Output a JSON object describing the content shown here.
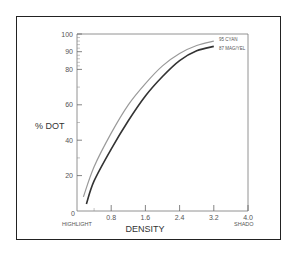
{
  "chart_data": {
    "type": "line",
    "title": "",
    "xlabel": "DENSITY",
    "ylabel": "% DOT",
    "xlim": [
      0,
      4.0
    ],
    "ylim": [
      0,
      100
    ],
    "x_ticks": [
      "0",
      "0.8",
      "1.6",
      "2.4",
      "3.2",
      "4.0"
    ],
    "y_ticks": [
      "20",
      "40",
      "60",
      "80",
      "90",
      "100"
    ],
    "x_end_labels": {
      "left": "HIGHLIGHT",
      "right": "SHADOW"
    },
    "grid": false,
    "legend_position": "inline-right",
    "series": [
      {
        "name": "95 CYAN",
        "color": "#9a9a9a",
        "x": [
          0.15,
          0.4,
          0.8,
          1.2,
          1.6,
          2.0,
          2.4,
          2.8,
          3.2
        ],
        "y": [
          8,
          25,
          44,
          60,
          72,
          82,
          89,
          93.5,
          96
        ]
      },
      {
        "name": "87 MAG/YEL",
        "color": "#333333",
        "x": [
          0.22,
          0.4,
          0.8,
          1.2,
          1.6,
          2.0,
          2.4,
          2.8,
          3.2
        ],
        "y": [
          4,
          17,
          35,
          51,
          65,
          76,
          85,
          90.5,
          93
        ]
      }
    ]
  },
  "labels": {
    "ylabel": "% DOT",
    "xlabel": "DENSITY",
    "highlight": "HIGHLIGHT",
    "shadow": "SHADO",
    "zero": "0",
    "legend_cyan": "95 CYAN",
    "legend_magyel": "87 MAG/YEL"
  }
}
